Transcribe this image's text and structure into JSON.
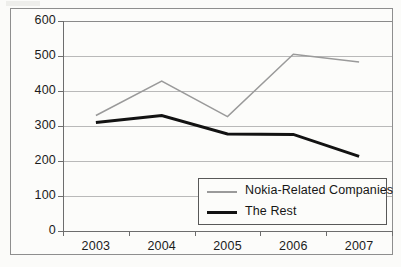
{
  "chart_data": {
    "type": "line",
    "title": "",
    "xlabel": "",
    "ylabel": "",
    "categories": [
      "2003",
      "2004",
      "2005",
      "2006",
      "2007"
    ],
    "ylim": [
      0,
      600
    ],
    "ytick_labels": [
      "600",
      "500",
      "400",
      "300",
      "200",
      "100",
      "0"
    ],
    "ytick_values": [
      600,
      500,
      400,
      300,
      200,
      100,
      0
    ],
    "grid": "horizontal",
    "legend_position": "bottom-right",
    "series": [
      {
        "name": "Nokia-Related Companies",
        "values": [
          330,
          428,
          327,
          505,
          483
        ],
        "color": "#9a9a9a",
        "line_width": 1.5
      },
      {
        "name": "The Rest",
        "values": [
          310,
          330,
          277,
          276,
          213
        ],
        "color": "#121212",
        "line_width": 3
      }
    ]
  },
  "legend": {
    "entries": [
      {
        "label": "Nokia-Related Companies"
      },
      {
        "label": "The Rest"
      }
    ]
  },
  "colors": {
    "series_a": "#9a9a9a",
    "series_b": "#121212",
    "gridline": "#b9b9b9",
    "axis": "#6d6d6d",
    "border": "#8e8e8e",
    "background": "#fbfbf9",
    "text": "#1b1b1b"
  }
}
